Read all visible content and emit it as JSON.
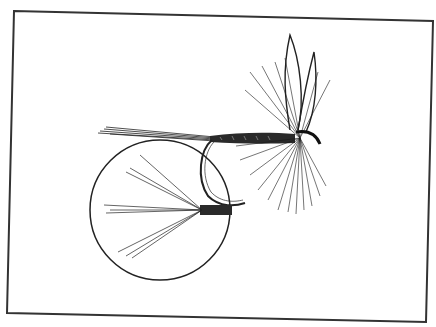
{
  "illustration": {
    "subject": "dry fly fishing lure with inset detail of tail fibres",
    "colors": {
      "background": "#ffffff",
      "ink": "#1a1a1a",
      "frame": "#333333"
    },
    "frame": {
      "corners": [
        [
          14,
          11
        ],
        [
          433,
          21
        ],
        [
          426,
          322
        ],
        [
          7,
          313
        ]
      ]
    },
    "inset_circle": {
      "cx": 160,
      "cy": 210,
      "r": 70
    }
  }
}
